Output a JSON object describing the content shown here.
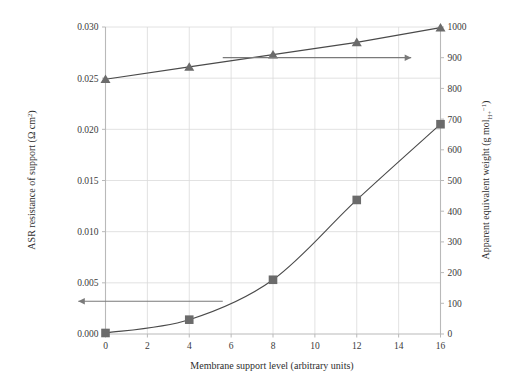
{
  "chart_data": {
    "type": "line",
    "title": "",
    "xlabel": "Membrane support level (arbitrary units)",
    "ylabel_left": "ASR resistance of support (Ω cm²)",
    "ylabel_right": "Apparent equivalent weight (g molₕ₊⁻¹)",
    "ylabel_left_parts": {
      "text": "ASR resistance of support (Ω cm",
      "sup": "2",
      "tail": ")"
    },
    "ylabel_right_parts": {
      "text": "Apparent equivalent weight (g mol",
      "sub": "H+",
      "sup": "−1",
      "tail": ")"
    },
    "xlim": [
      0,
      16
    ],
    "ylim_left": [
      0.0,
      0.03
    ],
    "ylim_right": [
      0,
      1000
    ],
    "xticks": [
      0,
      2,
      4,
      6,
      8,
      10,
      12,
      14,
      16
    ],
    "xtick_labels": [
      "0",
      "2",
      "4",
      "6",
      "8",
      "10",
      "12",
      "14",
      "16"
    ],
    "yticks_left": [
      0.0,
      0.005,
      0.01,
      0.015,
      0.02,
      0.025,
      0.03
    ],
    "ytick_labels_left": [
      "0.000",
      "0.005",
      "0.010",
      "0.015",
      "0.020",
      "0.025",
      "0.030"
    ],
    "yticks_right": [
      0,
      100,
      200,
      300,
      400,
      500,
      600,
      700,
      800,
      900,
      1000
    ],
    "ytick_labels_right": [
      "0",
      "100",
      "200",
      "300",
      "400",
      "500",
      "600",
      "700",
      "800",
      "900",
      "1000"
    ],
    "grid": true,
    "legend": "none",
    "x": [
      0,
      4,
      8,
      12,
      16
    ],
    "series": [
      {
        "name": "ASR resistance of support",
        "axis": "left",
        "marker": "square",
        "color": "#6b6b6b",
        "values": [
          0.0001,
          0.0014,
          0.0053,
          0.0131,
          0.0205
        ]
      },
      {
        "name": "Apparent equivalent weight",
        "axis": "right",
        "marker": "triangle",
        "color": "#6b6b6b",
        "values": [
          830,
          870,
          910,
          950,
          998
        ]
      }
    ],
    "annotations": [
      {
        "name": "arrow-to-right-axis",
        "type": "arrow",
        "direction": "right",
        "x_start": 5.6,
        "x_end": 14.6,
        "y_right_axis": 900
      },
      {
        "name": "arrow-to-left-axis",
        "type": "arrow",
        "direction": "left",
        "x_start": 5.6,
        "x_end": -1.3,
        "y_left_axis": 0.0032
      }
    ],
    "colors": {
      "marker": "#6b6b6b",
      "line": "#4a4a4a",
      "grid": "#dadada",
      "axis": "#b9b9b9",
      "text": "#333333",
      "arrow": "#7a7a7a"
    }
  }
}
